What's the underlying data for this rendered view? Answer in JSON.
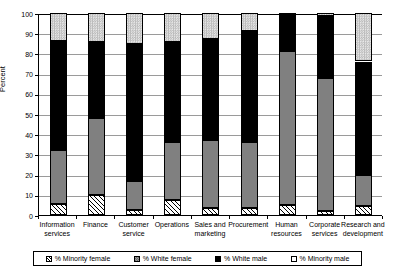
{
  "chart_data": {
    "type": "bar",
    "subtype": "stacked-bar-100",
    "title": "",
    "xlabel": "",
    "ylabel": "Percent",
    "ylim": [
      0,
      100
    ],
    "yticks": [
      0,
      10,
      20,
      30,
      40,
      50,
      60,
      70,
      80,
      90,
      100
    ],
    "ytick_labels": [
      "0",
      "10",
      "20",
      "30",
      "40",
      "50",
      "60",
      "70",
      "80",
      "90",
      "100"
    ],
    "grid": true,
    "legend_position": "bottom",
    "categories": [
      "Information services",
      "Finance",
      "Customer service",
      "Operations",
      "Sales and marketing",
      "Procurement",
      "Human resources",
      "Corporate services",
      "Research and development"
    ],
    "category_lines": [
      [
        "Information",
        "services"
      ],
      [
        "Finance",
        ""
      ],
      [
        "Customer",
        "service"
      ],
      [
        "Operations",
        ""
      ],
      [
        "Sales and",
        "marketing"
      ],
      [
        "Procurement",
        ""
      ],
      [
        "Human",
        "resources"
      ],
      [
        "Corporate",
        "services"
      ],
      [
        "Research and",
        "development"
      ]
    ],
    "series": [
      {
        "name": "% Minority female",
        "pattern": "diagonal-hatch",
        "color": "#ffffff",
        "values": [
          5.5,
          10,
          2.5,
          7.5,
          3.5,
          3.5,
          5,
          2,
          4.5
        ]
      },
      {
        "name": "% White female",
        "pattern": "solid-gray",
        "color": "#808080",
        "values": [
          26.5,
          38,
          14.5,
          28.5,
          33.5,
          32.5,
          76,
          66,
          15.5
        ]
      },
      {
        "name": "% White male",
        "pattern": "solid-black",
        "color": "#000000",
        "values": [
          54,
          37.5,
          67.5,
          49.5,
          50,
          55,
          19,
          30.5,
          56
        ]
      },
      {
        "name": "% Minority male",
        "pattern": "checker-light",
        "color": "#d4d4d4",
        "values": [
          14,
          14.5,
          15.5,
          14.5,
          13,
          9,
          0,
          1.5,
          24
        ]
      }
    ],
    "cumulative_tops": {
      "minority_female": [
        5.5,
        10,
        2.5,
        7.5,
        3.5,
        3.5,
        5,
        2,
        4.5
      ],
      "white_female": [
        32,
        48,
        17,
        36,
        37,
        36,
        81,
        68,
        20
      ],
      "white_male": [
        86,
        85.5,
        84.5,
        85.5,
        87,
        91,
        100,
        98.5,
        76
      ],
      "minority_male": [
        100,
        100,
        100,
        100,
        100,
        100,
        100,
        100,
        100
      ]
    }
  },
  "legend": {
    "items": [
      {
        "label": "% Minority female",
        "swatch": "minority-female"
      },
      {
        "label": "% White female",
        "swatch": "white-female"
      },
      {
        "label": "% White male",
        "swatch": "white-male"
      },
      {
        "label": "% Minority male",
        "swatch": "minority-male"
      }
    ]
  },
  "axis": {
    "y_title": "Percent"
  }
}
